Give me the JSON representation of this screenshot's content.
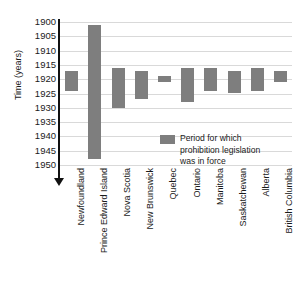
{
  "chart_data": {
    "type": "bar",
    "title": "",
    "subtitle": "",
    "xlabel": "",
    "ylabel": "Time (years)",
    "ylim": [
      1900,
      1950
    ],
    "y_inverted": true,
    "grid": true,
    "y_ticks": [
      1900,
      1905,
      1910,
      1915,
      1920,
      1925,
      1930,
      1935,
      1940,
      1945,
      1950
    ],
    "y_tick_labels": [
      "1900",
      "1905",
      "1910",
      "1915",
      "1920",
      "1925",
      "1930",
      "1935",
      "1940",
      "1945",
      "1950"
    ],
    "categories": [
      "Newfoundland",
      "Prince Edward Island",
      "Nova Scotia",
      "New Brunswick",
      "Quebec",
      "Ontario",
      "Manitoba",
      "Saskatchewan",
      "Alberta",
      "British Columbia"
    ],
    "series": [
      {
        "name": "Period for which prohibition legislation was in force",
        "color": "#7e7e7e",
        "type": "range",
        "ranges": [
          {
            "category": "Newfoundland",
            "start": 1917,
            "end": 1924
          },
          {
            "category": "Prince Edward Island",
            "start": 1901,
            "end": 1948
          },
          {
            "category": "Nova Scotia",
            "start": 1916,
            "end": 1930
          },
          {
            "category": "New Brunswick",
            "start": 1917,
            "end": 1927
          },
          {
            "category": "Quebec",
            "start": 1919,
            "end": 1921
          },
          {
            "category": "Ontario",
            "start": 1916,
            "end": 1928
          },
          {
            "category": "Manitoba",
            "start": 1916,
            "end": 1924
          },
          {
            "category": "Saskatchewan",
            "start": 1917,
            "end": 1925
          },
          {
            "category": "Alberta",
            "start": 1916,
            "end": 1924
          },
          {
            "category": "British Columbia",
            "start": 1917,
            "end": 1921
          }
        ]
      }
    ],
    "legend_position": "inside-lower-right",
    "gridline_color": "#d9d9d9",
    "bar_color": "#7e7e7e",
    "axis_color": "#111111"
  },
  "legend": {
    "line1": "Period for which",
    "line2": "prohibition legislation",
    "line3": "was in force",
    "swatch_name": "legend-color-swatch"
  }
}
